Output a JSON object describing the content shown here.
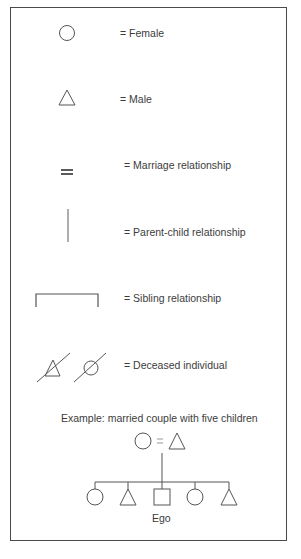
{
  "legend": {
    "items": [
      {
        "symbol": "circle-icon",
        "label": "= Female"
      },
      {
        "symbol": "triangle-icon",
        "label": "= Male"
      },
      {
        "symbol": "double-line-icon",
        "label": "= Marriage relationship"
      },
      {
        "symbol": "vertical-line-icon",
        "label": "= Parent-child relationship"
      },
      {
        "symbol": "bracket-icon",
        "label": "= Sibling relationship"
      },
      {
        "symbol": "slashed-triangle-and-circle-icon",
        "label": "= Deceased individual"
      }
    ]
  },
  "example": {
    "title": "Example: married couple with five children",
    "parents": [
      "female",
      "male"
    ],
    "parents_connector": "=",
    "children": [
      "female",
      "male",
      "ego",
      "female",
      "male"
    ],
    "ego_label": "Ego"
  },
  "colors": {
    "line": "#555555",
    "text": "#3c3c3c",
    "border": "#4a4a4a"
  }
}
